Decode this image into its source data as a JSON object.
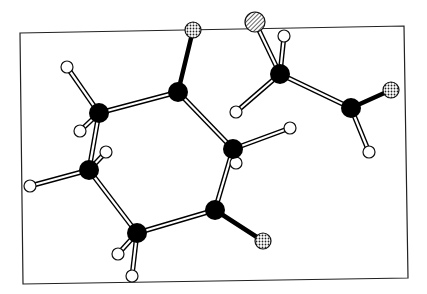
{
  "diagram": {
    "type": "ball-and-stick molecular structure",
    "frame": {
      "points": [
        [
          20,
          33
        ],
        [
          404,
          26
        ],
        [
          408,
          278
        ],
        [
          23,
          284
        ]
      ],
      "color": "#222222"
    },
    "atom_styles": {
      "carbon": {
        "fill": "#000000",
        "r": 10
      },
      "hydrogen": {
        "fill": "#ffffff",
        "stroke": "#111111",
        "r": 6
      },
      "oxygen": {
        "fill": "dotted",
        "r": 8
      },
      "hetero": {
        "fill": "hatched",
        "r": 10
      }
    },
    "atoms": [
      {
        "id": "C1",
        "type": "carbon",
        "x": 99,
        "y": 113
      },
      {
        "id": "C2",
        "type": "carbon",
        "x": 178,
        "y": 92
      },
      {
        "id": "C3",
        "type": "carbon",
        "x": 233,
        "y": 149
      },
      {
        "id": "C4",
        "type": "carbon",
        "x": 215,
        "y": 210
      },
      {
        "id": "C5",
        "type": "carbon",
        "x": 137,
        "y": 233
      },
      {
        "id": "C6",
        "type": "carbon",
        "x": 89,
        "y": 170
      },
      {
        "id": "C7",
        "type": "carbon",
        "x": 280,
        "y": 74
      },
      {
        "id": "C8",
        "type": "carbon",
        "x": 351,
        "y": 108
      },
      {
        "id": "O1",
        "type": "oxygen",
        "x": 193,
        "y": 30
      },
      {
        "id": "O2",
        "type": "oxygen",
        "x": 263,
        "y": 241
      },
      {
        "id": "O3",
        "type": "oxygen",
        "x": 391,
        "y": 90
      },
      {
        "id": "X1",
        "type": "hetero",
        "x": 255,
        "y": 22
      },
      {
        "id": "H1",
        "type": "hydrogen",
        "x": 67,
        "y": 67
      },
      {
        "id": "H2",
        "type": "hydrogen",
        "x": 80,
        "y": 131
      },
      {
        "id": "H3",
        "type": "hydrogen",
        "x": 106,
        "y": 152
      },
      {
        "id": "H4",
        "type": "hydrogen",
        "x": 30,
        "y": 186
      },
      {
        "id": "H5",
        "type": "hydrogen",
        "x": 118,
        "y": 254
      },
      {
        "id": "H6",
        "type": "hydrogen",
        "x": 132,
        "y": 276
      },
      {
        "id": "H7",
        "type": "hydrogen",
        "x": 236,
        "y": 112
      },
      {
        "id": "H8",
        "type": "hydrogen",
        "x": 290,
        "y": 128
      },
      {
        "id": "H9",
        "type": "hydrogen",
        "x": 284,
        "y": 36
      },
      {
        "id": "H10",
        "type": "hydrogen",
        "x": 236,
        "y": 163
      },
      {
        "id": "H11",
        "type": "hydrogen",
        "x": 369,
        "y": 152
      }
    ],
    "bonds": [
      {
        "a": "C1",
        "b": "C2",
        "style": "open"
      },
      {
        "a": "C2",
        "b": "C3",
        "style": "open"
      },
      {
        "a": "C3",
        "b": "C4",
        "style": "open"
      },
      {
        "a": "C4",
        "b": "C5",
        "style": "open"
      },
      {
        "a": "C5",
        "b": "C6",
        "style": "open"
      },
      {
        "a": "C6",
        "b": "C1",
        "style": "open"
      },
      {
        "a": "C2",
        "b": "O1",
        "style": "solid"
      },
      {
        "a": "C4",
        "b": "O2",
        "style": "solid"
      },
      {
        "a": "C8",
        "b": "O3",
        "style": "solid"
      },
      {
        "a": "C7",
        "b": "C8",
        "style": "open"
      },
      {
        "a": "C7",
        "b": "X1",
        "style": "open"
      },
      {
        "a": "C1",
        "b": "H1",
        "style": "open"
      },
      {
        "a": "C1",
        "b": "H2",
        "style": "open"
      },
      {
        "a": "C6",
        "b": "H3",
        "style": "open"
      },
      {
        "a": "C6",
        "b": "H4",
        "style": "open"
      },
      {
        "a": "C5",
        "b": "H5",
        "style": "open"
      },
      {
        "a": "C5",
        "b": "H6",
        "style": "open"
      },
      {
        "a": "C7",
        "b": "H7",
        "style": "open"
      },
      {
        "a": "C3",
        "b": "H8",
        "style": "open"
      },
      {
        "a": "C7",
        "b": "H9",
        "style": "open"
      },
      {
        "a": "C3",
        "b": "H10",
        "style": "open"
      },
      {
        "a": "C8",
        "b": "H11",
        "style": "open"
      }
    ]
  }
}
